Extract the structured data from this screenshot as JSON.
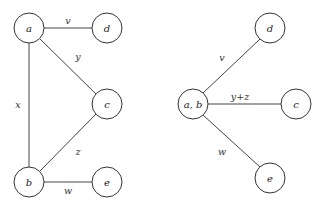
{
  "left_graph": {
    "nodes": {
      "a": {
        "label": "a",
        "x": 29,
        "y": 28
      },
      "d": {
        "label": "d",
        "x": 107,
        "y": 28
      },
      "c": {
        "label": "c",
        "x": 107,
        "y": 104
      },
      "b": {
        "label": "b",
        "x": 29,
        "y": 182
      },
      "e": {
        "label": "e",
        "x": 107,
        "y": 182
      }
    },
    "edges": {
      "ad": {
        "label": "v",
        "lx": 68,
        "ly": 20
      },
      "ac": {
        "label": "y",
        "lx": 78,
        "ly": 56
      },
      "ab": {
        "label": "x",
        "lx": 18,
        "ly": 104
      },
      "bc": {
        "label": "z",
        "lx": 78,
        "ly": 151
      },
      "be": {
        "label": "w",
        "lx": 68,
        "ly": 190
      }
    }
  },
  "right_graph": {
    "nodes": {
      "ab": {
        "label": "a, b",
        "x": 193,
        "y": 104
      },
      "d": {
        "label": "d",
        "x": 270,
        "y": 28
      },
      "c": {
        "label": "c",
        "x": 296,
        "y": 104
      },
      "e": {
        "label": "e",
        "x": 270,
        "y": 178
      }
    },
    "edges": {
      "abd": {
        "label": "v",
        "lx": 222,
        "ly": 57
      },
      "abc": {
        "label": "y+z",
        "lx": 240,
        "ly": 96
      },
      "abe": {
        "label": "w",
        "lx": 222,
        "ly": 151
      }
    }
  }
}
